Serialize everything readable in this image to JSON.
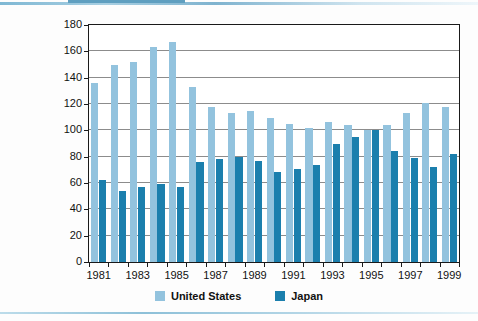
{
  "chart_data": {
    "type": "bar",
    "title": "",
    "subtitle": "",
    "xlabel": "",
    "ylabel": "",
    "ylim": [
      0,
      180
    ],
    "ytick_values": [
      0,
      20,
      40,
      60,
      80,
      100,
      120,
      140,
      160,
      180
    ],
    "ytick_labels": [
      "0",
      "20",
      "40",
      "60",
      "80",
      "100",
      "120",
      "140",
      "160",
      "180"
    ],
    "grid": true,
    "legend_position": "bottom-center",
    "categories": [
      "1981",
      "1982",
      "1983",
      "1984",
      "1985",
      "1986",
      "1987",
      "1988",
      "1989",
      "1990",
      "1991",
      "1992",
      "1993",
      "1994",
      "1995",
      "1996",
      "1997",
      "1998",
      "1999"
    ],
    "xtick_labels": [
      "1981",
      "1983",
      "1985",
      "1987",
      "1989",
      "1991",
      "1993",
      "1995",
      "1997",
      "1999"
    ],
    "series": [
      {
        "name": "United States",
        "color": "#93c3de",
        "values": [
          136,
          150,
          152,
          163,
          167,
          133,
          118,
          113,
          115,
          109,
          105,
          102,
          106,
          104,
          100,
          104,
          113,
          121,
          118
        ]
      },
      {
        "name": "Japan",
        "color": "#1b7fad",
        "values": [
          62,
          54,
          57,
          59,
          57,
          76,
          78,
          80,
          77,
          68,
          71,
          74,
          90,
          95,
          100,
          84,
          79,
          72,
          82
        ]
      }
    ]
  },
  "legend": {
    "items": [
      {
        "label": "United States",
        "color": "#93c3de"
      },
      {
        "label": "Japan",
        "color": "#1b7fad"
      }
    ]
  },
  "decor": {
    "top_rule_color": "#7fb8d4",
    "bottom_rule_color": "#8dc0d8"
  }
}
